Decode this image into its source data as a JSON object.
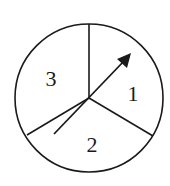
{
  "diagram": {
    "type": "spinner",
    "sections": [
      {
        "label": "1"
      },
      {
        "label": "2"
      },
      {
        "label": "3"
      }
    ],
    "pointer": "arrow-pointing-into-section-1"
  }
}
